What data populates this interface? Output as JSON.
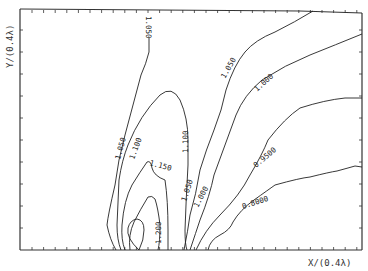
{
  "chart_data": {
    "type": "contour",
    "title": "",
    "xlabel": "X/(0.4λ)",
    "ylabel": "Y/(0.4λ)",
    "grid": false,
    "legend": "none",
    "tick_labels": "none (unlabeled tick marks)",
    "contour_levels": [
      "0.8000",
      "0.9500",
      "1.000",
      "1.050",
      "1.100",
      "1.150",
      "1.200"
    ],
    "contour_labels": [
      {
        "text": "1.050",
        "position": "top-left, vertical near top edge"
      },
      {
        "text": "1.050",
        "position": "left branch, middle"
      },
      {
        "text": "1.100",
        "position": "left branch of dome"
      },
      {
        "text": "1.100",
        "position": "right branch of dome"
      },
      {
        "text": "1.150",
        "position": "lower-center"
      },
      {
        "text": "1.200",
        "position": "bottom-center near source"
      },
      {
        "text": "1.050",
        "position": "right, upper"
      },
      {
        "text": "1.050",
        "position": "right, lower"
      },
      {
        "text": "1.000",
        "position": "right, upper"
      },
      {
        "text": "1.000",
        "position": "right, lower"
      },
      {
        "text": "0.9500",
        "position": "right-center"
      },
      {
        "text": "0.8000",
        "position": "lower-right"
      }
    ],
    "source_region_x_fraction": [
      0.33,
      0.46
    ]
  },
  "axes": {
    "xlabel": "X/(0.4λ)",
    "ylabel": "Y/(0.4λ)"
  },
  "labels": {
    "l1050_top": "1.050",
    "l1050_left": "1.050",
    "l1100_left": "1.100",
    "l1100_right": "1.100",
    "l1150": "1.150",
    "l1200": "1.200",
    "l1050_r_up": "1.050",
    "l1050_r_low": "1.050",
    "l1000_r_up": "1.000",
    "l1000_r_low": "1.000",
    "l0950": "0.9500",
    "l0800": "0.8000"
  }
}
